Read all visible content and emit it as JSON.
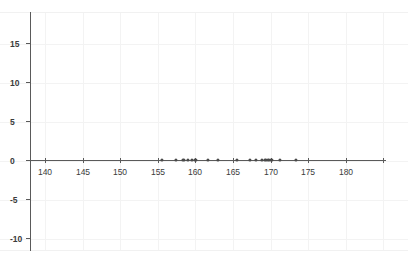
{
  "chart_data": {
    "type": "scatter",
    "title": "",
    "subtitle": "",
    "xlabel": "",
    "ylabel": "",
    "xlim": [
      137.5,
      185.5
    ],
    "ylim": [
      -11.5,
      17.5
    ],
    "grid": true,
    "legend": null,
    "x_ticks": [
      140,
      145,
      150,
      155,
      160,
      165,
      170,
      175,
      180
    ],
    "x_tick_labels": [
      "140",
      "145",
      "150",
      "155",
      "160",
      "165",
      "170",
      "175",
      "180"
    ],
    "y_ticks": [
      15,
      10,
      5,
      0,
      -5,
      -10
    ],
    "y_tick_labels": [
      "15",
      "10",
      "5",
      "0",
      "-5",
      "-10"
    ],
    "marker_color": "#4a4a4a",
    "axis_color": "#5a5a5a",
    "grid_color": "#f3f3f3",
    "background_color": "#ffffff",
    "x": [
      155.6,
      157.4,
      158.4,
      159.0,
      159.5,
      160.0,
      161.7,
      163.0,
      165.5,
      167.3,
      168.1,
      168.8,
      169.3,
      169.7,
      170.1,
      171.2,
      173.4
    ],
    "y": [
      0,
      0,
      0,
      0,
      0,
      0,
      0,
      0,
      0,
      0,
      0,
      0,
      0,
      0,
      0,
      0,
      0
    ],
    "points": [
      {
        "x": 155.6,
        "y": 0
      },
      {
        "x": 157.4,
        "y": 0
      },
      {
        "x": 158.4,
        "y": 0
      },
      {
        "x": 159.0,
        "y": 0
      },
      {
        "x": 159.5,
        "y": 0
      },
      {
        "x": 160.0,
        "y": 0
      },
      {
        "x": 161.7,
        "y": 0
      },
      {
        "x": 163.0,
        "y": 0
      },
      {
        "x": 165.5,
        "y": 0
      },
      {
        "x": 167.3,
        "y": 0
      },
      {
        "x": 168.1,
        "y": 0
      },
      {
        "x": 168.8,
        "y": 0
      },
      {
        "x": 169.3,
        "y": 0
      },
      {
        "x": 169.7,
        "y": 0
      },
      {
        "x": 170.1,
        "y": 0
      },
      {
        "x": 171.2,
        "y": 0
      },
      {
        "x": 173.4,
        "y": 0
      }
    ]
  }
}
